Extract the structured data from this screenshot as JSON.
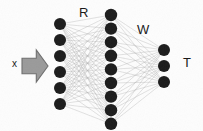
{
  "diagram": {
    "type": "neural-network",
    "background_color": "#fdfdfd",
    "node_color": "#1b1b1b",
    "edge_color": "#b4b4b4",
    "arrow_fill": "#9a9a9a",
    "arrow_stroke": "#6e6e6e",
    "labels": {
      "input": "x",
      "first_weights": "R",
      "second_weights": "W",
      "output": "T"
    },
    "input_arrow": {
      "name": "input-arrow",
      "x": 22,
      "y": 50,
      "width": 26,
      "height": 32
    },
    "layers": [
      {
        "name": "input-layer",
        "node_count": 6,
        "cx": 60,
        "y_start": 24,
        "y_step": 16.0,
        "radius": 6.0
      },
      {
        "name": "hidden-layer",
        "node_count": 9,
        "cx": 111,
        "y_start": 15,
        "y_step": 13.6,
        "radius": 6.2
      },
      {
        "name": "output-layer",
        "node_count": 3,
        "cx": 164,
        "y_start": 50,
        "y_step": 16.0,
        "radius": 6.0
      }
    ],
    "connections": [
      {
        "name": "edges-input-to-hidden",
        "from": 0,
        "to": 1,
        "label": "R"
      },
      {
        "name": "edges-hidden-to-output",
        "from": 1,
        "to": 2,
        "label": "W"
      }
    ]
  }
}
